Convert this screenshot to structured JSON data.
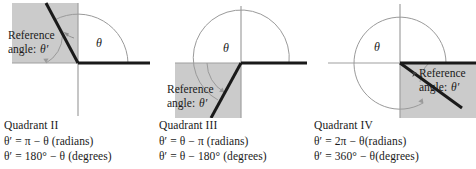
{
  "figure": {
    "colors": {
      "shade": "#cbcbcb",
      "axis": "#9a9a9a",
      "ray": "#1a1a1a",
      "arc": "#8f8f8f",
      "text": "#1a1a1a",
      "background": "#ffffff"
    }
  },
  "panels": [
    {
      "id": "quadrant-2",
      "quadrant_label": "Quadrant II",
      "reference_label_line1": "Reference",
      "reference_label_line2": "angle:",
      "reference_symbol": "θ′",
      "theta_symbol": "θ",
      "formula_radians": "θ′ = π − θ (radians)",
      "formula_degrees": "θ′ = 180° − θ (degrees)",
      "shaded_quadrant": "upper-left",
      "terminal_angle_deg": 118
    },
    {
      "id": "quadrant-3",
      "quadrant_label": "Quadrant III",
      "reference_label_line1": "Reference",
      "reference_label_line2": "angle:",
      "reference_symbol": "θ′",
      "theta_symbol": "θ",
      "formula_radians": "θ′ = θ − π (radians)",
      "formula_degrees": "θ′ = θ − 180° (degrees)",
      "shaded_quadrant": "lower-left",
      "terminal_angle_deg": 242
    },
    {
      "id": "quadrant-4",
      "quadrant_label": "Quadrant IV",
      "reference_label_line1": "Reference",
      "reference_label_line2": "angle:",
      "reference_symbol": "θ′",
      "theta_symbol": "θ",
      "formula_radians": "θ′ = 2π − θ(radians)",
      "formula_degrees": "θ′ = 360° − θ(degrees)",
      "shaded_quadrant": "lower-right",
      "terminal_angle_deg": 326
    }
  ]
}
